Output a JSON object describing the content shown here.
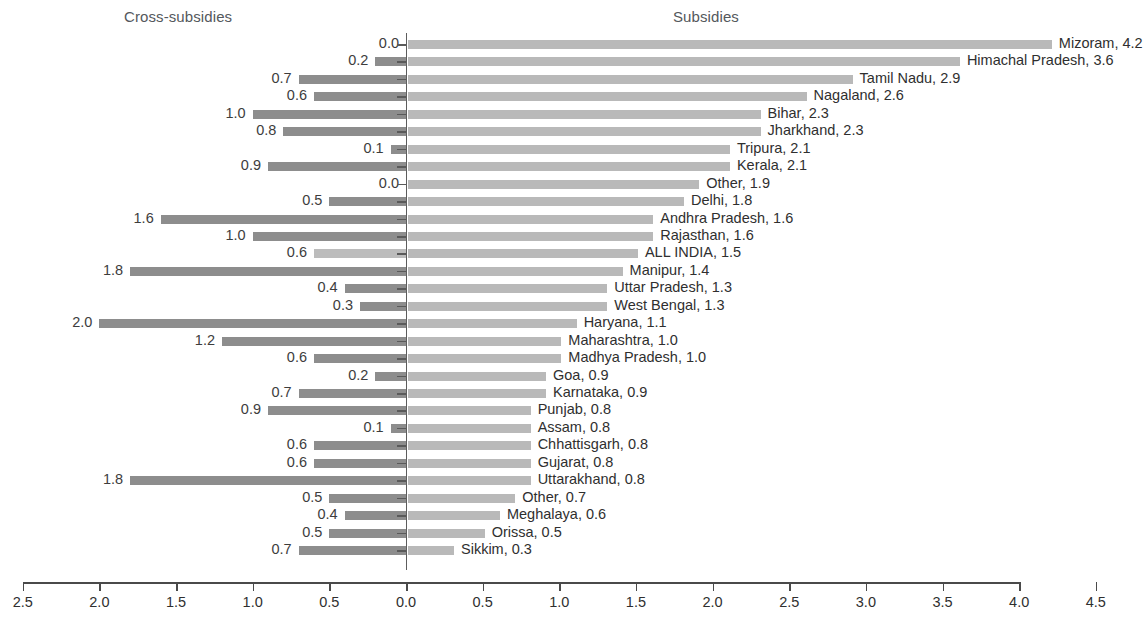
{
  "headers": {
    "left_panel_title": "Cross-subsidies",
    "right_panel_title": "Subsidies"
  },
  "chart_data": {
    "type": "bar",
    "orientation": "horizontal",
    "subtype": "diverging-bidirectional",
    "title": "",
    "subtitle": "",
    "xlabel": "",
    "ylabel": "",
    "left_panel_title": "Cross-subsidies",
    "right_panel_title": "Subsidies",
    "grid": false,
    "legend_position": "none",
    "axis": {
      "zero_at": 0.0,
      "left_max": 2.5,
      "right_max": 4.5,
      "tick_labels": [
        "2.5",
        "2.0",
        "1.5",
        "1.0",
        "0.5",
        "0.0",
        "0.5",
        "1.0",
        "1.5",
        "2.0",
        "2.5",
        "3.0",
        "3.5",
        "4.0",
        "4.5"
      ],
      "tick_values": [
        -2.5,
        -2.0,
        -1.5,
        -1.0,
        -0.5,
        0.0,
        0.5,
        1.0,
        1.5,
        2.0,
        2.5,
        3.0,
        3.5,
        4.0,
        4.5
      ]
    },
    "colors": {
      "subsidies_bar": "#b9b9b9",
      "cross_subsidies_bar": "#8d8d8d",
      "all_india_bar": "#bcbcbc",
      "axis": "#4a4a4a",
      "text": "#2f2f2f"
    },
    "categories": [
      "Mizoram",
      "Himachal Pradesh",
      "Tamil Nadu",
      "Nagaland",
      "Bihar",
      "Jharkhand",
      "Tripura",
      "Kerala",
      "Other",
      "Delhi",
      "Andhra Pradesh",
      "Rajasthan",
      "ALL INDIA",
      "Manipur",
      "Uttar Pradesh",
      "West Bengal",
      "Haryana",
      "Maharashtra",
      "Madhya Pradesh",
      "Goa",
      "Karnataka",
      "Punjab",
      "Assam",
      "Chhattisgarh",
      "Gujarat",
      "Uttarakhand",
      "Other",
      "Meghalaya",
      "Orissa",
      "Sikkim"
    ],
    "series": [
      {
        "name": "Subsidies",
        "side": "right",
        "values": [
          4.2,
          3.6,
          2.9,
          2.6,
          2.3,
          2.3,
          2.1,
          2.1,
          1.9,
          1.8,
          1.6,
          1.6,
          1.5,
          1.4,
          1.3,
          1.3,
          1.1,
          1.0,
          1.0,
          0.9,
          0.9,
          0.8,
          0.8,
          0.8,
          0.8,
          0.8,
          0.7,
          0.6,
          0.5,
          0.3
        ]
      },
      {
        "name": "Cross-subsidies",
        "side": "left",
        "values": [
          0.0,
          0.2,
          0.7,
          0.6,
          1.0,
          0.8,
          0.1,
          0.9,
          0.0,
          0.5,
          1.6,
          1.0,
          0.6,
          1.8,
          0.4,
          0.3,
          2.0,
          1.2,
          0.6,
          0.2,
          0.7,
          0.9,
          0.1,
          0.6,
          0.6,
          1.8,
          0.5,
          0.4,
          0.5,
          0.7
        ]
      }
    ],
    "rows": [
      {
        "category": "Mizoram",
        "subsidies": 4.2,
        "cross_subsidies": 0.0,
        "label": "Mizoram, 4.2",
        "left_value_label": "0.0",
        "highlight": false
      },
      {
        "category": "Himachal Pradesh",
        "subsidies": 3.6,
        "cross_subsidies": 0.2,
        "label": "Himachal Pradesh, 3.6",
        "left_value_label": "0.2",
        "highlight": false
      },
      {
        "category": "Tamil Nadu",
        "subsidies": 2.9,
        "cross_subsidies": 0.7,
        "label": "Tamil Nadu, 2.9",
        "left_value_label": "0.7",
        "highlight": false
      },
      {
        "category": "Nagaland",
        "subsidies": 2.6,
        "cross_subsidies": 0.6,
        "label": "Nagaland, 2.6",
        "left_value_label": "0.6",
        "highlight": false
      },
      {
        "category": "Bihar",
        "subsidies": 2.3,
        "cross_subsidies": 1.0,
        "label": "Bihar, 2.3",
        "left_value_label": "1.0",
        "highlight": false
      },
      {
        "category": "Jharkhand",
        "subsidies": 2.3,
        "cross_subsidies": 0.8,
        "label": "Jharkhand, 2.3",
        "left_value_label": "0.8",
        "highlight": false
      },
      {
        "category": "Tripura",
        "subsidies": 2.1,
        "cross_subsidies": 0.1,
        "label": "Tripura, 2.1",
        "left_value_label": "0.1",
        "highlight": false
      },
      {
        "category": "Kerala",
        "subsidies": 2.1,
        "cross_subsidies": 0.9,
        "label": "Kerala, 2.1",
        "left_value_label": "0.9",
        "highlight": false
      },
      {
        "category": "Other",
        "subsidies": 1.9,
        "cross_subsidies": 0.0,
        "label": "Other, 1.9",
        "left_value_label": "0.0",
        "highlight": false
      },
      {
        "category": "Delhi",
        "subsidies": 1.8,
        "cross_subsidies": 0.5,
        "label": "Delhi, 1.8",
        "left_value_label": "0.5",
        "highlight": false
      },
      {
        "category": "Andhra Pradesh",
        "subsidies": 1.6,
        "cross_subsidies": 1.6,
        "label": "Andhra Pradesh, 1.6",
        "left_value_label": "1.6",
        "highlight": false
      },
      {
        "category": "Rajasthan",
        "subsidies": 1.6,
        "cross_subsidies": 1.0,
        "label": "Rajasthan, 1.6",
        "left_value_label": "1.0",
        "highlight": false
      },
      {
        "category": "ALL INDIA",
        "subsidies": 1.5,
        "cross_subsidies": 0.6,
        "label": "ALL INDIA, 1.5",
        "left_value_label": "0.6",
        "highlight": true
      },
      {
        "category": "Manipur",
        "subsidies": 1.4,
        "cross_subsidies": 1.8,
        "label": "Manipur, 1.4",
        "left_value_label": "1.8",
        "highlight": false
      },
      {
        "category": "Uttar Pradesh",
        "subsidies": 1.3,
        "cross_subsidies": 0.4,
        "label": "Uttar Pradesh, 1.3",
        "left_value_label": "0.4",
        "highlight": false
      },
      {
        "category": "West Bengal",
        "subsidies": 1.3,
        "cross_subsidies": 0.3,
        "label": "West Bengal, 1.3",
        "left_value_label": "0.3",
        "highlight": false
      },
      {
        "category": "Haryana",
        "subsidies": 1.1,
        "cross_subsidies": 2.0,
        "label": "Haryana, 1.1",
        "left_value_label": "2.0",
        "highlight": false
      },
      {
        "category": "Maharashtra",
        "subsidies": 1.0,
        "cross_subsidies": 1.2,
        "label": "Maharashtra, 1.0",
        "left_value_label": "1.2",
        "highlight": false
      },
      {
        "category": "Madhya Pradesh",
        "subsidies": 1.0,
        "cross_subsidies": 0.6,
        "label": "Madhya Pradesh, 1.0",
        "left_value_label": "0.6",
        "highlight": false
      },
      {
        "category": "Goa",
        "subsidies": 0.9,
        "cross_subsidies": 0.2,
        "label": "Goa, 0.9",
        "left_value_label": "0.2",
        "highlight": false
      },
      {
        "category": "Karnataka",
        "subsidies": 0.9,
        "cross_subsidies": 0.7,
        "label": "Karnataka, 0.9",
        "left_value_label": "0.7",
        "highlight": false
      },
      {
        "category": "Punjab",
        "subsidies": 0.8,
        "cross_subsidies": 0.9,
        "label": "Punjab, 0.8",
        "left_value_label": "0.9",
        "highlight": false
      },
      {
        "category": "Assam",
        "subsidies": 0.8,
        "cross_subsidies": 0.1,
        "label": "Assam, 0.8",
        "left_value_label": "0.1",
        "highlight": false
      },
      {
        "category": "Chhattisgarh",
        "subsidies": 0.8,
        "cross_subsidies": 0.6,
        "label": "Chhattisgarh, 0.8",
        "left_value_label": "0.6",
        "highlight": false
      },
      {
        "category": "Gujarat",
        "subsidies": 0.8,
        "cross_subsidies": 0.6,
        "label": "Gujarat, 0.8",
        "left_value_label": "0.6",
        "highlight": false
      },
      {
        "category": "Uttarakhand",
        "subsidies": 0.8,
        "cross_subsidies": 1.8,
        "label": "Uttarakhand, 0.8",
        "left_value_label": "1.8",
        "highlight": false
      },
      {
        "category": "Other",
        "subsidies": 0.7,
        "cross_subsidies": 0.5,
        "label": "Other, 0.7",
        "left_value_label": "0.5",
        "highlight": false
      },
      {
        "category": "Meghalaya",
        "subsidies": 0.6,
        "cross_subsidies": 0.4,
        "label": "Meghalaya, 0.6",
        "left_value_label": "0.4",
        "highlight": false
      },
      {
        "category": "Orissa",
        "subsidies": 0.5,
        "cross_subsidies": 0.5,
        "label": "Orissa, 0.5",
        "left_value_label": "0.5",
        "highlight": false
      },
      {
        "category": "Sikkim",
        "subsidies": 0.3,
        "cross_subsidies": 0.7,
        "label": "Sikkim, 0.3",
        "left_value_label": "0.7",
        "highlight": false
      }
    ]
  }
}
